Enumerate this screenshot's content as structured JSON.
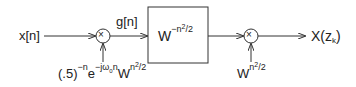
{
  "diagram": {
    "input_label": "x[n]",
    "intermediate_label": "g[n]",
    "filter_block": {
      "base": "W",
      "exponent": "−n²/2",
      "exp_main": "−n",
      "exp_sq": "2",
      "exp_tail": "/2"
    },
    "multiplier_symbol": "×",
    "premultiplier": {
      "base": "(.5)",
      "exp1": "−n",
      "e": "e",
      "exp2": "−jω",
      "exp2_sub": "0",
      "exp2_tail": "n",
      "w": "W",
      "w_exp": "n",
      "w_sq": "2",
      "w_tail": "/2"
    },
    "postmultiplier": {
      "base": "W",
      "exp": "n",
      "sq": "2",
      "tail": "/2"
    },
    "output_label": {
      "main": "X(z",
      "sub": "k",
      "close": ")"
    }
  }
}
